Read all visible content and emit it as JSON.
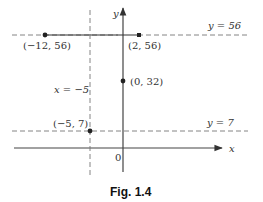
{
  "figure": {
    "caption": "Fig. 1.4",
    "axes": {
      "x_label": "x",
      "y_label": "y",
      "origin_label": "0"
    },
    "lines": [
      {
        "label": "y = 56",
        "type": "horizontal-dashed"
      },
      {
        "label": "y = 7",
        "type": "horizontal-dashed"
      },
      {
        "label": "x = −5",
        "type": "vertical-dashed"
      }
    ],
    "segment": {
      "from": "(−12, 56)",
      "to": "(2, 56)",
      "type": "solid"
    },
    "points": [
      {
        "label": "(−12, 56)"
      },
      {
        "label": "(2, 56)"
      },
      {
        "label": "(0, 32)"
      },
      {
        "label": "(−5, 7)"
      }
    ]
  },
  "colors": {
    "ink": "#333333",
    "dash": "#777777"
  }
}
